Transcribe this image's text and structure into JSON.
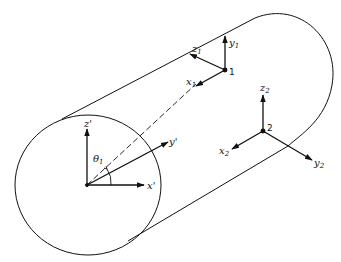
{
  "diagram": {
    "stroke_color": "#111111",
    "background": "#ffffff",
    "labels": {
      "z_prime": "z'",
      "y_prime": "y'",
      "x_prime": "x'",
      "theta_1": "θ",
      "theta_1_sub": "1",
      "z1": "z",
      "z1_sub": "1",
      "y1": "y",
      "y1_sub": "1",
      "x1": "x",
      "x1_sub": "1",
      "point1": "1",
      "z2": "z",
      "z2_sub": "2",
      "x2": "x",
      "x2_sub": "2",
      "y2": "y",
      "y2_sub": "2",
      "point2": "2"
    }
  }
}
